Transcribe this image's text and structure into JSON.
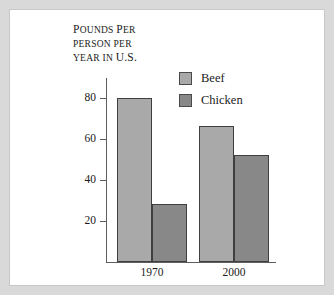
{
  "figure": {
    "background_color": "#d9d9d9",
    "panel_color": "#ffffff"
  },
  "chart_data": {
    "type": "bar",
    "title": "POUNDS PER PERSON PER YEAR IN U.S.",
    "title_lines": [
      "Pounds per",
      "person per",
      "year in U.S."
    ],
    "xlabel": "",
    "ylabel": "",
    "categories": [
      "1970",
      "2000"
    ],
    "series": [
      {
        "name": "Beef",
        "values": [
          80,
          66
        ],
        "color": "#a9a9a9"
      },
      {
        "name": "Chicken",
        "values": [
          28,
          52
        ],
        "color": "#888888"
      }
    ],
    "ylim": [
      0,
      90
    ],
    "yticks": [
      20,
      40,
      60,
      80
    ],
    "ytick_labels": [
      "20",
      "40",
      "60",
      "80"
    ],
    "grid": false,
    "legend_position": "top-right",
    "axis_color": "#5e5e5e",
    "bar_outline_color": "#3f3f3f"
  },
  "legend": {
    "entries": [
      {
        "label": "Beef",
        "color": "#a9a9a9"
      },
      {
        "label": "Chicken",
        "color": "#888888"
      }
    ]
  }
}
